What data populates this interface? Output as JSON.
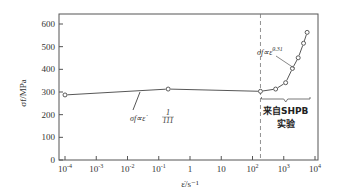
{
  "chart_data": {
    "type": "line",
    "title": "",
    "xlabel": "ε̇/s⁻¹",
    "ylabel": "σf/MPa",
    "xscale": "log",
    "xlim_log10": [
      -4,
      4
    ],
    "ylim": [
      0,
      650
    ],
    "x_ticks": [
      {
        "exp": -4,
        "label": "10",
        "sup": "-4"
      },
      {
        "exp": -3,
        "label": "10",
        "sup": "-3"
      },
      {
        "exp": -2,
        "label": "10",
        "sup": "-2"
      },
      {
        "exp": -1,
        "label": "10",
        "sup": "-1"
      },
      {
        "exp": 0,
        "label": "1",
        "sup": ""
      },
      {
        "exp": 1,
        "label": "10",
        "sup": ""
      },
      {
        "exp": 2,
        "label": "10",
        "sup": "2"
      },
      {
        "exp": 3,
        "label": "10",
        "sup": "3"
      },
      {
        "exp": 4,
        "label": "10",
        "sup": "4"
      }
    ],
    "y_ticks": [
      0,
      100,
      200,
      300,
      400,
      500,
      600
    ],
    "grid": false,
    "series": [
      {
        "name": "flow stress",
        "points": [
          {
            "x": 0.0001,
            "y": 287
          },
          {
            "x": 0.2,
            "y": 313
          },
          {
            "x": 180,
            "y": 303
          },
          {
            "x": 550,
            "y": 313
          },
          {
            "x": 1150,
            "y": 341
          },
          {
            "x": 1900,
            "y": 404
          },
          {
            "x": 2900,
            "y": 451
          },
          {
            "x": 4300,
            "y": 515
          },
          {
            "x": 5600,
            "y": 563
          }
        ]
      }
    ],
    "vline": {
      "x": 180,
      "style": "dashed"
    },
    "annotations": [
      {
        "id": "low",
        "prefix": "σf∝ε̇",
        "exponent_num": "1",
        "exponent_den": "111"
      },
      {
        "id": "high",
        "prefix": "σf∝ε̇",
        "exponent": "0.31"
      },
      {
        "id": "shpb",
        "line1": "来自SHPB",
        "line2": "实验"
      }
    ]
  }
}
